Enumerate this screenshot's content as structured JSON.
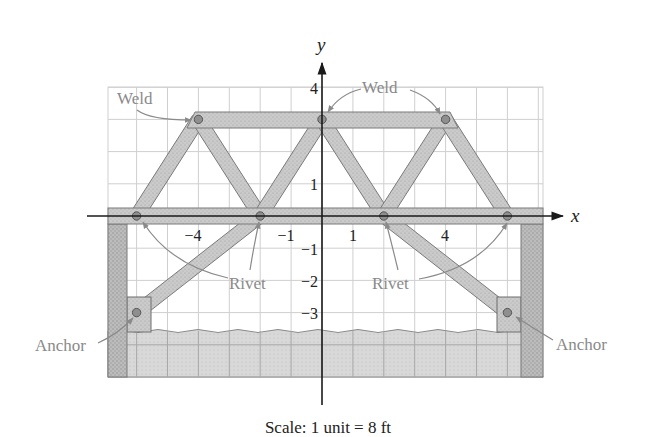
{
  "figure": {
    "caption": "Scale: 1 unit = 8 ft",
    "axes": {
      "x_label": "x",
      "y_label": "y"
    },
    "ticks": {
      "x": [
        {
          "value": -4,
          "label": "−4"
        },
        {
          "value": -1,
          "label": "−1"
        },
        {
          "value": 1,
          "label": "1"
        },
        {
          "value": 4,
          "label": "4"
        }
      ],
      "y": [
        {
          "value": 4,
          "label": "4"
        },
        {
          "value": 1,
          "label": "1"
        },
        {
          "value": -1,
          "label": "−1"
        },
        {
          "value": -2,
          "label": "−2"
        },
        {
          "value": -3,
          "label": "−3"
        }
      ]
    },
    "callouts": {
      "weld_left": "Weld",
      "weld_right": "Weld",
      "rivet_left": "Rivet",
      "rivet_right": "Rivet",
      "anchor_left": "Anchor",
      "anchor_right": "Anchor"
    },
    "grid": {
      "x_min": -7,
      "x_max": 7,
      "y_min": -5,
      "y_max": 4,
      "step": 1
    },
    "scale": {
      "units": 1,
      "feet": 8
    },
    "joints": {
      "welds": [
        [
          -4,
          3
        ],
        [
          0,
          3
        ],
        [
          4,
          3
        ]
      ],
      "rivets": [
        [
          -6,
          0
        ],
        [
          -2,
          0
        ],
        [
          2,
          0
        ],
        [
          6,
          0
        ]
      ],
      "anchors": [
        [
          -6,
          -3
        ],
        [
          6,
          -3
        ]
      ]
    },
    "members": [
      [
        [
          -6,
          0
        ],
        [
          -4,
          3
        ]
      ],
      [
        [
          -4,
          3
        ],
        [
          -2,
          0
        ]
      ],
      [
        [
          -2,
          0
        ],
        [
          0,
          3
        ]
      ],
      [
        [
          0,
          3
        ],
        [
          2,
          0
        ]
      ],
      [
        [
          2,
          0
        ],
        [
          4,
          3
        ]
      ],
      [
        [
          4,
          3
        ],
        [
          6,
          0
        ]
      ],
      [
        [
          -2,
          0
        ],
        [
          -6,
          -3
        ]
      ],
      [
        [
          2,
          0
        ],
        [
          6,
          -3
        ]
      ]
    ],
    "colors": {
      "member_fill": "#c9c9c9",
      "member_stroke": "#7a7a7a",
      "pillar_fill": "#b9b9b9",
      "ground_fill": "#d6d6d6",
      "grid": "#cfcfcf",
      "axis": "#1a1a1a",
      "callout": "#8a8a8a"
    }
  }
}
